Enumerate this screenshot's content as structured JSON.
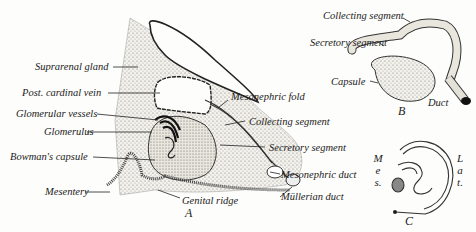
{
  "figure": {
    "panels": {
      "A": {
        "letter": "A",
        "labels": {
          "suprarenal_gland": "Suprarenal gland",
          "post_cardinal_vein": "Post. cardinal vein",
          "glomerular_vessels": "Glomerular vessels",
          "glomerulus": "Glomerulus",
          "bowmans_capsule": "Bowman's capsule",
          "mesentery": "Mesentery",
          "genital_ridge": "Genital ridge",
          "mesonephric_fold": "Mesonephric fold",
          "collecting_segment": "Collecting segment",
          "secretory_segment": "Secretory segment",
          "mesonephric_duct": "Mesonephric duct",
          "mullerian_duct": "Müllerian duct"
        }
      },
      "B": {
        "letter": "B",
        "labels": {
          "collecting_segment": "Collecting segment",
          "secretory_segment": "Secretory segment",
          "capsule": "Capsule",
          "duct": "Duct"
        }
      },
      "C": {
        "letter": "C",
        "labels": {
          "mes": [
            "M",
            "e",
            "s."
          ],
          "lat": [
            "L",
            "a",
            "t."
          ]
        }
      }
    }
  }
}
